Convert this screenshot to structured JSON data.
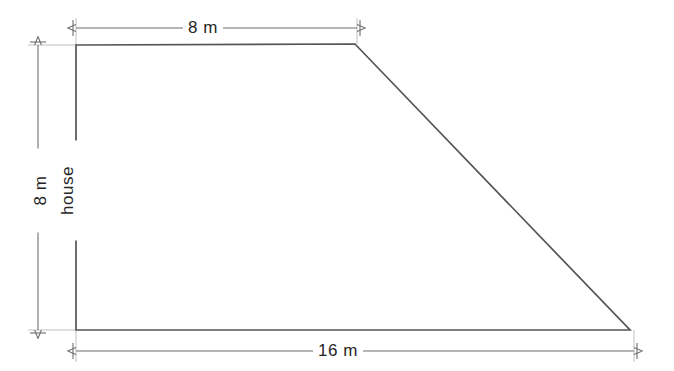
{
  "diagram": {
    "shape_type": "trapezoid",
    "stroke_color": "#555555",
    "dimension_line_color": "#6e6e6e",
    "background_color": "#ffffff",
    "text_color": "#262626",
    "interior_label": "house",
    "vertices": [
      {
        "name": "top-left",
        "x": 76,
        "y": 45
      },
      {
        "name": "top-right",
        "x": 355,
        "y": 44
      },
      {
        "name": "bottom-right",
        "x": 630,
        "y": 330
      },
      {
        "name": "bottom-left",
        "x": 76,
        "y": 330
      }
    ],
    "dimensions": {
      "top_width": {
        "label": "8 m",
        "value": 8,
        "unit": "m",
        "from_x": 76,
        "to_x": 357,
        "y": 28
      },
      "bottom_width": {
        "label": "16 m",
        "value": 16,
        "unit": "m",
        "from_x": 76,
        "to_x": 634,
        "y": 351
      },
      "left_height": {
        "label": "8 m",
        "value": 8,
        "unit": "m",
        "from_y": 45,
        "to_y": 330,
        "x": 38
      }
    }
  }
}
